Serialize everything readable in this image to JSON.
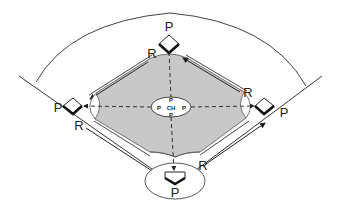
{
  "diagram": {
    "type": "baseball-infield-positions",
    "colors": {
      "infield_fill": "#c8c8c8",
      "line": "#333333",
      "base_fill": "#ffffff",
      "background": "#ffffff"
    },
    "labels": {
      "second_base_player": "P",
      "first_base_player": "P",
      "third_base_player": "P",
      "home_player": "P",
      "runner_2b_to_3b": "R",
      "runner_1b_to_2b": "R",
      "runner_3b_to_home": "R",
      "runner_home_to_1b": "R",
      "center_label": "CH",
      "center_top": "P",
      "center_bottom": "P",
      "center_left": "P",
      "center_right": "P"
    },
    "legend_meaning": {
      "P": "player/pitcher position",
      "R": "runner path",
      "CH": "center hub"
    }
  }
}
